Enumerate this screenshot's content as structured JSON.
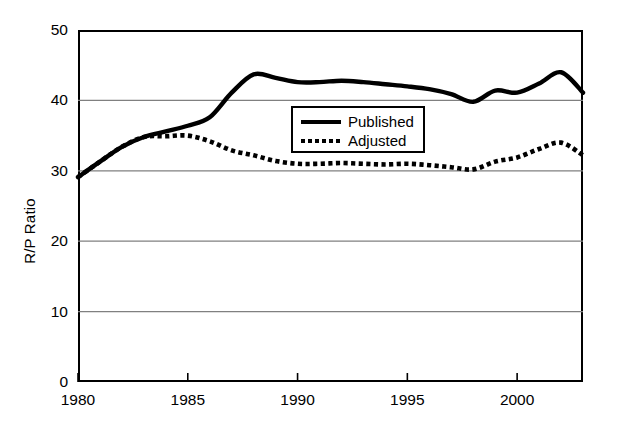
{
  "chart_data": {
    "type": "line",
    "title": "",
    "subtitle": "",
    "xlabel": "",
    "ylabel": "R/P Ratio",
    "xlim": [
      1980,
      2003
    ],
    "ylim": [
      0,
      50
    ],
    "grid": "horizontal",
    "legend_position": "inside-upper-center",
    "y_ticks": [
      0,
      10,
      20,
      30,
      40,
      50
    ],
    "y_tick_labels": [
      "0",
      "10",
      "20",
      "30",
      "40",
      "50"
    ],
    "x_ticks": [
      1980,
      1985,
      1990,
      1995,
      2000
    ],
    "x_tick_labels": [
      "1980",
      "1985",
      "1990",
      "1995",
      "2000"
    ],
    "x": [
      1980,
      1981,
      1982,
      1983,
      1984,
      1985,
      1986,
      1987,
      1988,
      1989,
      1990,
      1991,
      1992,
      1993,
      1994,
      1995,
      1996,
      1997,
      1998,
      1999,
      2000,
      2001,
      2002,
      2003
    ],
    "series": [
      {
        "name": "Published",
        "style": "solid",
        "color": "#000000",
        "values": [
          29.1,
          31.3,
          33.4,
          34.8,
          35.6,
          36.4,
          37.6,
          41.1,
          43.7,
          43.2,
          42.6,
          42.6,
          42.8,
          42.6,
          42.3,
          42.0,
          41.6,
          40.9,
          39.8,
          41.4,
          41.1,
          42.4,
          44.0,
          41.1
        ]
      },
      {
        "name": "Adjusted",
        "style": "dotted",
        "color": "#000000",
        "values": [
          29.1,
          31.3,
          33.4,
          34.8,
          34.9,
          35.0,
          34.2,
          32.9,
          32.2,
          31.4,
          31.0,
          31.0,
          31.1,
          31.0,
          30.9,
          31.0,
          30.8,
          30.5,
          30.2,
          31.3,
          31.9,
          33.1,
          34.0,
          32.2
        ]
      }
    ]
  },
  "legend": {
    "items": [
      {
        "label": "Published",
        "style": "solid"
      },
      {
        "label": "Adjusted",
        "style": "dotted"
      }
    ]
  }
}
